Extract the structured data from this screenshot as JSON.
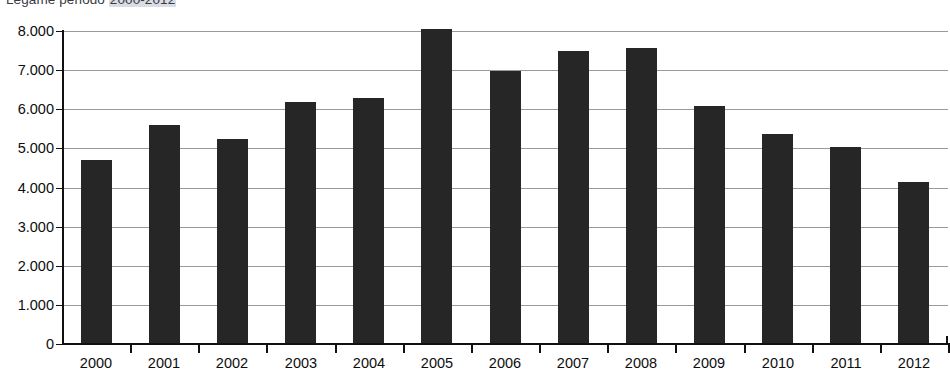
{
  "chart_data": {
    "type": "bar",
    "title": "Legame periodo 2000-2012",
    "title_prefix": "Legame periodo ",
    "title_highlight": "2000-2012",
    "xlabel": "",
    "ylabel": "",
    "categories": [
      "2000",
      "2001",
      "2002",
      "2003",
      "2004",
      "2005",
      "2006",
      "2007",
      "2008",
      "2009",
      "2010",
      "2011",
      "2012"
    ],
    "values": [
      4700,
      5600,
      5230,
      6180,
      6300,
      8050,
      6980,
      7480,
      7560,
      6080,
      5380,
      5030,
      4130
    ],
    "ylim": [
      0,
      8000
    ],
    "ytick_values": [
      0,
      1000,
      2000,
      3000,
      4000,
      5000,
      6000,
      7000,
      8000
    ],
    "ytick_labels": [
      "0",
      "1.000",
      "2.000",
      "3.000",
      "4.000",
      "5.000",
      "6.000",
      "7.000",
      "8.000"
    ],
    "grid": true,
    "grid_axis": "y",
    "legend": false,
    "legend_position": "none",
    "bar_color": "#262626",
    "grid_color": "#9a9a9a",
    "axis_color": "#111111",
    "background_color": "#ffffff",
    "number_format": "european-thousands-dot"
  }
}
